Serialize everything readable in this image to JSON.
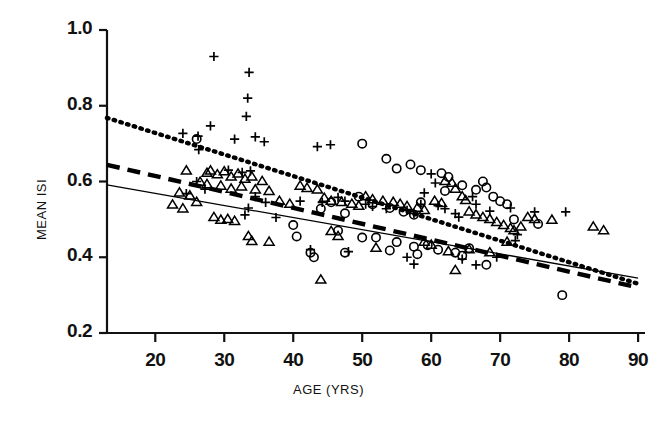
{
  "chart_data": {
    "type": "scatter",
    "title": "",
    "xlabel": "AGE  (YRS)",
    "ylabel": "MEAN ISI",
    "xlim": [
      13,
      91
    ],
    "ylim": [
      0.2,
      1.0
    ],
    "xticks": [
      20,
      30,
      40,
      50,
      60,
      70,
      80,
      90
    ],
    "yticks": [
      "0.2",
      "0.4",
      "0.6",
      "0.8",
      "1.0"
    ],
    "xtick_labels": [
      "20",
      "30",
      "40",
      "50",
      "60",
      "70",
      "80",
      "90"
    ],
    "ytick_labels": [
      "0.2",
      "0.4",
      "0.6",
      "0.8",
      "1.0"
    ],
    "grid": false,
    "legend": "none",
    "series": [
      {
        "name": "group-plus",
        "marker": "plus",
        "color": "#000000",
        "points": [
          [
            28.5,
            0.93
          ],
          [
            33.6,
            0.888
          ],
          [
            33.4,
            0.82
          ],
          [
            33.2,
            0.772
          ],
          [
            28.0,
            0.747
          ],
          [
            24.0,
            0.727
          ],
          [
            26.2,
            0.72
          ],
          [
            31.5,
            0.712
          ],
          [
            34.5,
            0.718
          ],
          [
            35.8,
            0.705
          ],
          [
            26.3,
            0.684
          ],
          [
            43.5,
            0.692
          ],
          [
            45.4,
            0.697
          ],
          [
            30.6,
            0.63
          ],
          [
            32.6,
            0.624
          ],
          [
            33.8,
            0.628
          ],
          [
            26.0,
            0.6
          ],
          [
            27.2,
            0.58
          ],
          [
            24.5,
            0.568
          ],
          [
            34.5,
            0.56
          ],
          [
            36.0,
            0.545
          ],
          [
            33.5,
            0.53
          ],
          [
            33.0,
            0.512
          ],
          [
            37.5,
            0.505
          ],
          [
            41.0,
            0.548
          ],
          [
            44.2,
            0.545
          ],
          [
            46.5,
            0.558
          ],
          [
            47.5,
            0.548
          ],
          [
            50.5,
            0.54
          ],
          [
            51.5,
            0.534
          ],
          [
            53.5,
            0.528
          ],
          [
            56.5,
            0.524
          ],
          [
            57.5,
            0.516
          ],
          [
            60.0,
            0.62
          ],
          [
            60.6,
            0.596
          ],
          [
            59.0,
            0.57
          ],
          [
            58.5,
            0.54
          ],
          [
            61.0,
            0.536
          ],
          [
            62.0,
            0.528
          ],
          [
            63.5,
            0.515
          ],
          [
            64.0,
            0.506
          ],
          [
            66.0,
            0.56
          ],
          [
            66.5,
            0.54
          ],
          [
            68.5,
            0.522
          ],
          [
            71.5,
            0.53
          ],
          [
            75.0,
            0.52
          ],
          [
            79.5,
            0.52
          ],
          [
            42.5,
            0.42
          ],
          [
            48.0,
            0.415
          ],
          [
            56.5,
            0.4
          ],
          [
            57.5,
            0.382
          ],
          [
            64.5,
            0.395
          ],
          [
            66.5,
            0.38
          ],
          [
            69.5,
            0.4
          ],
          [
            72.5,
            0.46
          ],
          [
            72.2,
            0.444
          ]
        ]
      },
      {
        "name": "group-triangle",
        "marker": "triangle",
        "color": "#000000",
        "points": [
          [
            24.5,
            0.628
          ],
          [
            27.5,
            0.622
          ],
          [
            28.0,
            0.628
          ],
          [
            29.0,
            0.618
          ],
          [
            30.0,
            0.626
          ],
          [
            31.0,
            0.612
          ],
          [
            32.0,
            0.62
          ],
          [
            33.0,
            0.606
          ],
          [
            34.0,
            0.612
          ],
          [
            35.5,
            0.6
          ],
          [
            26.5,
            0.598
          ],
          [
            27.5,
            0.592
          ],
          [
            29.5,
            0.588
          ],
          [
            31.0,
            0.58
          ],
          [
            32.5,
            0.586
          ],
          [
            34.5,
            0.578
          ],
          [
            36.5,
            0.574
          ],
          [
            23.5,
            0.57
          ],
          [
            25.0,
            0.562
          ],
          [
            26.0,
            0.545
          ],
          [
            22.5,
            0.538
          ],
          [
            24.0,
            0.528
          ],
          [
            28.5,
            0.505
          ],
          [
            29.5,
            0.498
          ],
          [
            30.5,
            0.5
          ],
          [
            31.5,
            0.495
          ],
          [
            33.5,
            0.455
          ],
          [
            34.0,
            0.442
          ],
          [
            36.5,
            0.44
          ],
          [
            38.0,
            0.548
          ],
          [
            39.5,
            0.54
          ],
          [
            41.0,
            0.588
          ],
          [
            42.0,
            0.582
          ],
          [
            43.5,
            0.578
          ],
          [
            44.5,
            0.556
          ],
          [
            45.5,
            0.548
          ],
          [
            47.0,
            0.545
          ],
          [
            48.5,
            0.54
          ],
          [
            49.5,
            0.535
          ],
          [
            50.5,
            0.56
          ],
          [
            51.5,
            0.552
          ],
          [
            53.0,
            0.548
          ],
          [
            54.5,
            0.545
          ],
          [
            55.5,
            0.54
          ],
          [
            56.5,
            0.534
          ],
          [
            58.0,
            0.53
          ],
          [
            59.0,
            0.524
          ],
          [
            60.5,
            0.548
          ],
          [
            61.5,
            0.542
          ],
          [
            62.0,
            0.6
          ],
          [
            63.0,
            0.596
          ],
          [
            63.5,
            0.58
          ],
          [
            64.5,
            0.56
          ],
          [
            65.0,
            0.55
          ],
          [
            65.5,
            0.52
          ],
          [
            66.5,
            0.512
          ],
          [
            67.5,
            0.505
          ],
          [
            68.5,
            0.5
          ],
          [
            69.5,
            0.492
          ],
          [
            70.5,
            0.484
          ],
          [
            71.5,
            0.476
          ],
          [
            72.0,
            0.47
          ],
          [
            73.0,
            0.48
          ],
          [
            74.0,
            0.505
          ],
          [
            75.0,
            0.5
          ],
          [
            77.5,
            0.498
          ],
          [
            83.5,
            0.48
          ],
          [
            85.0,
            0.47
          ],
          [
            45.5,
            0.468
          ],
          [
            46.5,
            0.455
          ],
          [
            52.0,
            0.424
          ],
          [
            59.0,
            0.44
          ],
          [
            60.0,
            0.432
          ],
          [
            62.5,
            0.415
          ],
          [
            65.5,
            0.42
          ],
          [
            68.5,
            0.412
          ],
          [
            71.0,
            0.44
          ],
          [
            44.0,
            0.34
          ],
          [
            63.5,
            0.365
          ]
        ]
      },
      {
        "name": "group-circle",
        "marker": "circle",
        "color": "#000000",
        "points": [
          [
            26.0,
            0.712
          ],
          [
            50.0,
            0.7
          ],
          [
            53.5,
            0.66
          ],
          [
            57.0,
            0.645
          ],
          [
            55.0,
            0.634
          ],
          [
            58.5,
            0.63
          ],
          [
            61.5,
            0.622
          ],
          [
            62.5,
            0.612
          ],
          [
            62.0,
            0.575
          ],
          [
            64.5,
            0.59
          ],
          [
            66.5,
            0.578
          ],
          [
            67.5,
            0.6
          ],
          [
            68.0,
            0.584
          ],
          [
            69.0,
            0.56
          ],
          [
            70.0,
            0.548
          ],
          [
            71.0,
            0.54
          ],
          [
            49.5,
            0.56
          ],
          [
            51.5,
            0.54
          ],
          [
            54.0,
            0.53
          ],
          [
            56.0,
            0.52
          ],
          [
            57.5,
            0.512
          ],
          [
            58.5,
            0.545
          ],
          [
            47.5,
            0.516
          ],
          [
            45.5,
            0.545
          ],
          [
            44.0,
            0.528
          ],
          [
            40.0,
            0.485
          ],
          [
            46.5,
            0.47
          ],
          [
            50.0,
            0.452
          ],
          [
            52.0,
            0.452
          ],
          [
            55.0,
            0.44
          ],
          [
            57.5,
            0.428
          ],
          [
            59.5,
            0.432
          ],
          [
            61.0,
            0.42
          ],
          [
            63.5,
            0.412
          ],
          [
            64.5,
            0.404
          ],
          [
            65.5,
            0.424
          ],
          [
            75.5,
            0.488
          ],
          [
            43.0,
            0.4
          ],
          [
            47.5,
            0.412
          ],
          [
            54.0,
            0.418
          ],
          [
            58.0,
            0.408
          ],
          [
            68.0,
            0.38
          ],
          [
            79.0,
            0.3
          ],
          [
            72.0,
            0.5
          ],
          [
            40.5,
            0.455
          ],
          [
            42.5,
            0.412
          ]
        ]
      }
    ],
    "fit_lines": [
      {
        "name": "dotted-fit",
        "style": "dotted",
        "x1": 13,
        "y1": 0.768,
        "x2": 90,
        "y2": 0.33
      },
      {
        "name": "dashed-fit",
        "style": "dashed",
        "x1": 13,
        "y1": 0.644,
        "x2": 90,
        "y2": 0.32
      },
      {
        "name": "solid-fit",
        "style": "solid",
        "x1": 13,
        "y1": 0.591,
        "x2": 90,
        "y2": 0.345
      }
    ]
  }
}
